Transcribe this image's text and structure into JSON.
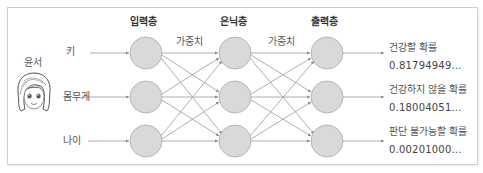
{
  "person": {
    "name": "윤서",
    "avatar_icon": "girl-face-icon"
  },
  "layers": {
    "input": {
      "title": "입력층"
    },
    "hidden": {
      "title": "은닉층"
    },
    "output": {
      "title": "출력층"
    }
  },
  "weights": [
    {
      "label": "가중치"
    },
    {
      "label": "가중치"
    }
  ],
  "inputs": [
    {
      "label": "키"
    },
    {
      "label": "몸무게"
    },
    {
      "label": "나이"
    }
  ],
  "outputs": [
    {
      "label": "건강할 확률",
      "value": "0.81794949..."
    },
    {
      "label": "건강하지 않을 확률",
      "value": "0.18004051..."
    },
    {
      "label": "판단 불가능할 확률",
      "value": "0.00201000..."
    }
  ],
  "colors": {
    "node_fill": "#d9d9d9",
    "node_stroke": "#a8a8a8",
    "edge": "#9a9a9a",
    "border": "#cfcfcf"
  }
}
